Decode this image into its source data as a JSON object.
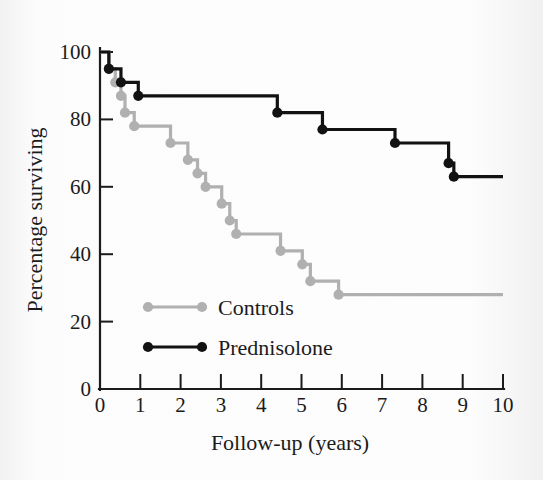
{
  "chart_data": {
    "type": "line",
    "subtype": "kaplan-meier-step",
    "title": "",
    "xlabel": "Follow-up (years)",
    "ylabel": "Percentage surviving",
    "xlim": [
      0,
      10
    ],
    "ylim": [
      0,
      100
    ],
    "xticks": [
      0,
      1,
      2,
      3,
      4,
      5,
      6,
      7,
      8,
      9,
      10
    ],
    "xtick_labels": [
      "0",
      "1",
      "2",
      "3",
      "4",
      "5",
      "6",
      "7",
      "8",
      "9",
      "10"
    ],
    "yticks": [
      0,
      20,
      40,
      60,
      80,
      100
    ],
    "ytick_labels": [
      "0",
      "20",
      "40",
      "60",
      "80",
      "100"
    ],
    "grid": false,
    "legend_position": "inside-lower-left",
    "series": [
      {
        "name": "Controls",
        "color": "#b0b0b0",
        "marker": "circle",
        "points": [
          {
            "x": 0.0,
            "y": 100
          },
          {
            "x": 0.22,
            "y": 95
          },
          {
            "x": 0.38,
            "y": 91
          },
          {
            "x": 0.52,
            "y": 87
          },
          {
            "x": 0.62,
            "y": 82
          },
          {
            "x": 0.85,
            "y": 78
          },
          {
            "x": 1.75,
            "y": 73
          },
          {
            "x": 2.18,
            "y": 68
          },
          {
            "x": 2.42,
            "y": 64
          },
          {
            "x": 2.62,
            "y": 60
          },
          {
            "x": 3.02,
            "y": 55
          },
          {
            "x": 3.22,
            "y": 50
          },
          {
            "x": 3.38,
            "y": 46
          },
          {
            "x": 4.48,
            "y": 41
          },
          {
            "x": 5.02,
            "y": 37
          },
          {
            "x": 5.22,
            "y": 32
          },
          {
            "x": 5.92,
            "y": 28
          },
          {
            "x": 10.0,
            "y": 28
          }
        ]
      },
      {
        "name": "Prednisolone",
        "color": "#121212",
        "marker": "circle",
        "points": [
          {
            "x": 0.0,
            "y": 100
          },
          {
            "x": 0.22,
            "y": 95
          },
          {
            "x": 0.52,
            "y": 91
          },
          {
            "x": 0.95,
            "y": 87
          },
          {
            "x": 4.4,
            "y": 82
          },
          {
            "x": 5.52,
            "y": 77
          },
          {
            "x": 7.32,
            "y": 73
          },
          {
            "x": 8.65,
            "y": 67
          },
          {
            "x": 8.78,
            "y": 63
          },
          {
            "x": 10.0,
            "y": 63
          }
        ]
      }
    ]
  },
  "legend": {
    "items": [
      {
        "label": "Controls",
        "color": "#b0b0b0"
      },
      {
        "label": "Prednisolone",
        "color": "#121212"
      }
    ]
  },
  "axes": {
    "x_title": "Follow-up (years)",
    "y_title": "Percentage surviving"
  }
}
